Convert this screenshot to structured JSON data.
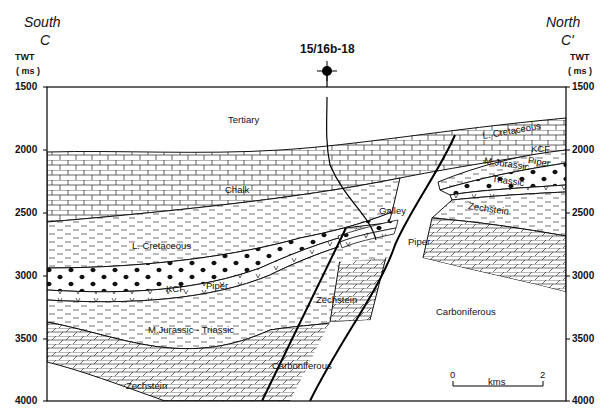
{
  "header": {
    "left_direction": "South",
    "left_label": "C",
    "right_direction": "North",
    "right_label": "C'",
    "axis_title": "TWT",
    "axis_units": "( ms )",
    "well_name": "15/16b-18"
  },
  "axis": {
    "ticks": [
      "1500",
      "2000",
      "2500",
      "3000",
      "3500",
      "4000"
    ],
    "range_ms": [
      1500,
      4000
    ]
  },
  "units": {
    "tertiary": "Tertiary",
    "chalk": "Chalk",
    "l_cretaceous": "L. Cretaceous",
    "l_cretaceous_north": "L. Cretaceous",
    "kcf": "KCF",
    "kcf_north": "KCF",
    "piper": "Piper",
    "piper_north": "Piper",
    "piper_fault": "Piper",
    "galley": "Galley",
    "mjurassic_triassic": "M.Jurassic - Triassic",
    "mjurassic_north": "M.Jurassic",
    "triassic_north": "Triassic",
    "zechstein_south": "Zechstein",
    "zechstein_mid": "Zechstein",
    "zechstein_north": "Zechstein",
    "carboniferous_mid": "Carboniferous",
    "carboniferous_north": "Carboniferous"
  },
  "scale_bar": {
    "start": "0",
    "end": "2",
    "unit": "kms"
  },
  "colors": {
    "line": "#111111",
    "background": "#ffffff"
  }
}
